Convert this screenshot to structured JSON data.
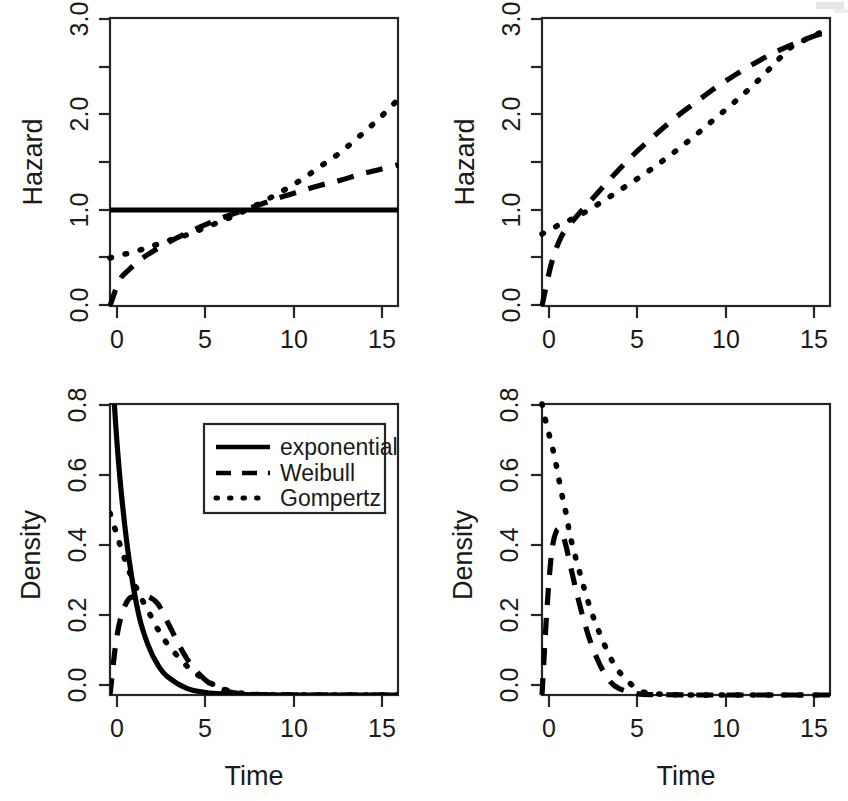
{
  "figure": {
    "background": "#ffffff",
    "ink_color": "#1a1a1a",
    "curve_color": "#000000",
    "width": 848,
    "height": 801,
    "panel_count": 4
  },
  "series_styles": {
    "exponential": "solid",
    "Weibull": "dashed",
    "Gompertz": "dotted"
  },
  "legend": {
    "position": "top-right of bottom-left panel",
    "entries": [
      {
        "label": "exponential",
        "style": "solid"
      },
      {
        "label": "Weibull",
        "style": "dashed"
      },
      {
        "label": "Gompertz",
        "style": "dotted"
      }
    ]
  },
  "chart_data": [
    {
      "id": "top-left",
      "type": "line",
      "title": "",
      "xlabel": "",
      "ylabel": "Hazard",
      "xlim": [
        0,
        15
      ],
      "ylim": [
        0,
        3
      ],
      "xticks": [
        0,
        5,
        10,
        15
      ],
      "xtick_labels": [
        "0",
        "5",
        "10",
        "15"
      ],
      "yticks": [
        0.0,
        0.5,
        1.0,
        1.5,
        2.0,
        2.5,
        3.0
      ],
      "ytick_labels": [
        "0.0",
        "",
        "1.0",
        "",
        "2.0",
        "",
        "3.0"
      ],
      "grid": false,
      "x": [
        0,
        0.5,
        1,
        1.5,
        2,
        3,
        4,
        5,
        6,
        7,
        8,
        9,
        10,
        11,
        12,
        13,
        14,
        15
      ],
      "series": [
        {
          "name": "exponential",
          "style": "solid",
          "values": [
            1,
            1,
            1,
            1,
            1,
            1,
            1,
            1,
            1,
            1,
            1,
            1,
            1,
            1,
            1,
            1,
            1,
            1
          ]
        },
        {
          "name": "Weibull",
          "style": "dashed",
          "values": [
            0.0,
            0.27,
            0.38,
            0.47,
            0.54,
            0.66,
            0.76,
            0.85,
            0.93,
            1.0,
            1.07,
            1.14,
            1.2,
            1.26,
            1.31,
            1.37,
            1.42,
            1.47
          ]
        },
        {
          "name": "Gompertz",
          "style": "dotted",
          "values": [
            0.5,
            0.53,
            0.55,
            0.58,
            0.61,
            0.68,
            0.74,
            0.82,
            0.9,
            0.99,
            1.09,
            1.2,
            1.32,
            1.46,
            1.6,
            1.77,
            1.95,
            2.15
          ]
        }
      ]
    },
    {
      "id": "top-right",
      "type": "line",
      "title": "",
      "xlabel": "",
      "ylabel": "Hazard",
      "xlim": [
        0,
        15
      ],
      "ylim": [
        0,
        3
      ],
      "xticks": [
        0,
        5,
        10,
        15
      ],
      "xtick_labels": [
        "0",
        "5",
        "10",
        "15"
      ],
      "yticks": [
        0.0,
        0.5,
        1.0,
        1.5,
        2.0,
        2.5,
        3.0
      ],
      "ytick_labels": [
        "0.0",
        "",
        "1.0",
        "",
        "2.0",
        "",
        "3.0"
      ],
      "grid": false,
      "x": [
        0,
        0.5,
        1,
        1.5,
        2,
        3,
        4,
        5,
        6,
        7,
        8,
        9,
        10,
        11,
        12,
        13,
        14,
        15
      ],
      "series": [
        {
          "name": "Weibull",
          "style": "dashed",
          "values": [
            0.0,
            0.45,
            0.72,
            0.86,
            0.98,
            1.2,
            1.42,
            1.62,
            1.8,
            1.97,
            2.12,
            2.27,
            2.4,
            2.52,
            2.63,
            2.72,
            2.8,
            2.86
          ]
        },
        {
          "name": "Gompertz",
          "style": "dotted",
          "values": [
            0.75,
            0.8,
            0.86,
            0.9,
            0.95,
            1.07,
            1.2,
            1.33,
            1.47,
            1.62,
            1.78,
            1.95,
            2.12,
            2.3,
            2.5,
            2.7,
            2.8,
            2.9
          ]
        }
      ]
    },
    {
      "id": "bottom-left",
      "type": "line",
      "title": "",
      "xlabel": "Time",
      "ylabel": "Density",
      "xlim": [
        0,
        15
      ],
      "ylim": [
        0,
        0.8
      ],
      "xticks": [
        0,
        5,
        10,
        15
      ],
      "xtick_labels": [
        "0",
        "5",
        "10",
        "15"
      ],
      "yticks": [
        0.0,
        0.2,
        0.4,
        0.6,
        0.8
      ],
      "ytick_labels": [
        "0.0",
        "0.2",
        "0.4",
        "0.6",
        "0.8"
      ],
      "grid": false,
      "x": [
        0,
        0.3,
        0.6,
        1,
        1.5,
        2,
        2.5,
        3,
        4,
        5,
        6,
        7,
        8,
        10,
        12,
        15
      ],
      "series": [
        {
          "name": "exponential",
          "style": "solid",
          "values": [
            1.0,
            0.74,
            0.55,
            0.37,
            0.22,
            0.135,
            0.082,
            0.05,
            0.018,
            0.0067,
            0.0025,
            0.001,
            0.0003,
            0.0,
            0.0,
            0.0
          ]
        },
        {
          "name": "Weibull",
          "style": "dashed",
          "values": [
            0.0,
            0.14,
            0.22,
            0.265,
            0.27,
            0.27,
            0.25,
            0.2,
            0.1,
            0.04,
            0.012,
            0.003,
            0.001,
            0.0,
            0.0,
            0.0
          ]
        },
        {
          "name": "Gompertz",
          "style": "dotted",
          "values": [
            0.5,
            0.45,
            0.4,
            0.34,
            0.28,
            0.23,
            0.18,
            0.14,
            0.08,
            0.04,
            0.015,
            0.004,
            0.001,
            0.0,
            0.0,
            0.0
          ]
        }
      ]
    },
    {
      "id": "bottom-right",
      "type": "line",
      "title": "",
      "xlabel": "Time",
      "ylabel": "Density",
      "xlim": [
        0,
        15
      ],
      "ylim": [
        0,
        0.8
      ],
      "xticks": [
        0,
        5,
        10,
        15
      ],
      "xtick_labels": [
        "0",
        "5",
        "10",
        "15"
      ],
      "yticks": [
        0.0,
        0.2,
        0.4,
        0.6,
        0.8
      ],
      "ytick_labels": [
        "0.0",
        "0.2",
        "0.4",
        "0.6",
        "0.8"
      ],
      "grid": false,
      "x": [
        0,
        0.25,
        0.5,
        0.75,
        1,
        1.25,
        1.5,
        2,
        2.5,
        3,
        3.5,
        4,
        5,
        6,
        8,
        10,
        12,
        15
      ],
      "series": [
        {
          "name": "Weibull",
          "style": "dashed",
          "values": [
            0.0,
            0.23,
            0.39,
            0.45,
            0.45,
            0.41,
            0.35,
            0.24,
            0.15,
            0.085,
            0.04,
            0.018,
            0.003,
            0.001,
            0.0,
            0.0,
            0.0,
            0.0
          ]
        },
        {
          "name": "Gompertz",
          "style": "dotted",
          "values": [
            0.8,
            0.74,
            0.69,
            0.63,
            0.56,
            0.5,
            0.43,
            0.33,
            0.24,
            0.17,
            0.11,
            0.065,
            0.015,
            0.003,
            0.0,
            0.0,
            0.0,
            0.0
          ]
        }
      ]
    }
  ]
}
